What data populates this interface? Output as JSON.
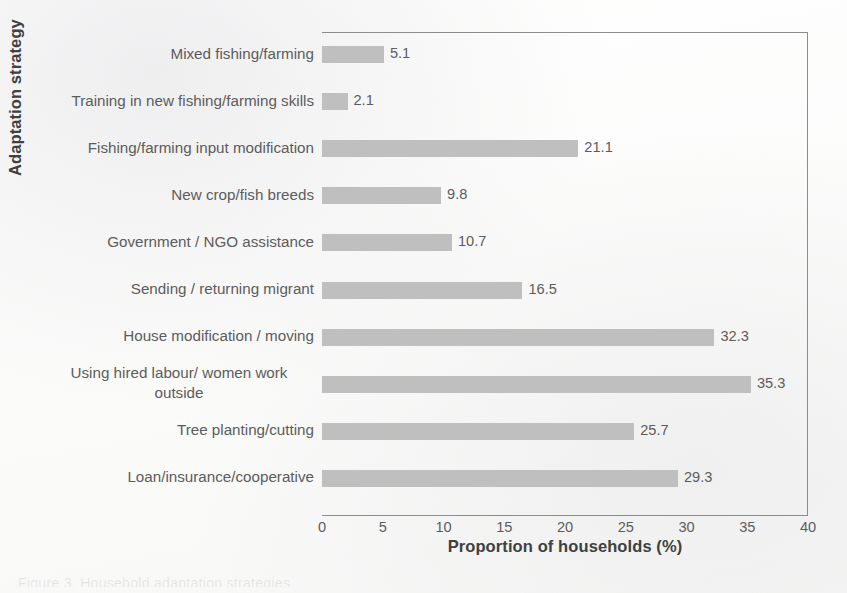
{
  "chart_data": {
    "type": "bar",
    "orientation": "horizontal",
    "title": "",
    "xlabel": "Proportion of households (%)",
    "ylabel": "Adaptation strategy",
    "xlim": [
      0,
      40
    ],
    "xticks": [
      "0",
      "5",
      "10",
      "15",
      "20",
      "25",
      "30",
      "35",
      "40"
    ],
    "grid": false,
    "legend": null,
    "bar_color": "#bfbfbf",
    "categories": [
      "Mixed fishing/farming",
      "Training in new fishing/farming skills",
      "Fishing/farming input modification",
      "New crop/fish breeds",
      "Government / NGO assistance",
      "Sending / returning migrant",
      "House modification / moving",
      "Using hired labour/ women work\noutside",
      "Tree planting/cutting",
      "Loan/insurance/cooperative"
    ],
    "values": [
      5.1,
      2.1,
      21.1,
      9.8,
      10.7,
      16.5,
      32.3,
      35.3,
      25.7,
      29.3
    ],
    "value_labels": [
      "5.1",
      "2.1",
      "21.1",
      "9.8",
      "10.7",
      "16.5",
      "32.3",
      "35.3",
      "25.7",
      "29.3"
    ]
  },
  "colors": {
    "bar": "#bfbfbf",
    "label_text": "#5c5c5c",
    "axis_title_text": "#404040",
    "axis_line": "#8c8c8c",
    "background": "#fdfdfc"
  },
  "caption_cutoff": "Figure 3. Household adaptation strategies"
}
